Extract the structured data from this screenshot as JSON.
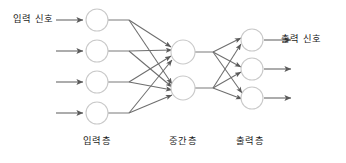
{
  "diagram": {
    "type": "neural-network",
    "title_visible": false,
    "background_color": "#ffffff",
    "node_stroke_color": "#c9c9c9",
    "edge_color": "#6e6e6e",
    "text_color": "#1b1b1b",
    "labels": {
      "input_signal": "입력 신호",
      "output_signal": "출력 신호",
      "layer_input": "입력층",
      "layer_hidden": "중간층",
      "layer_output": "출력층"
    },
    "layers": [
      {
        "id": "input",
        "label": "입력층",
        "node_count": 4,
        "center_x": 97,
        "node_radius": 11,
        "node_centers_y": [
          20,
          51,
          82,
          113
        ]
      },
      {
        "id": "hidden",
        "label": "중간층",
        "node_count": 2,
        "center_x": 183,
        "node_radius": 12,
        "node_centers_y": [
          52,
          88
        ]
      },
      {
        "id": "output",
        "label": "출력층",
        "node_count": 3,
        "center_x": 252,
        "node_radius": 11,
        "node_centers_y": [
          40,
          69,
          98
        ]
      }
    ],
    "connections": {
      "input_to_hidden": "fully-connected",
      "hidden_to_output": "fully-connected",
      "input_fan_x": 129,
      "hidden_fan_x": 213,
      "arrowheads": true
    },
    "external_arrows": {
      "input_arrow_count": 4,
      "input_arrow_x_start": 56,
      "input_arrow_x_end": 84,
      "output_arrow_count": 3,
      "output_arrow_x_start": 265,
      "output_arrow_x_end": 292
    }
  }
}
